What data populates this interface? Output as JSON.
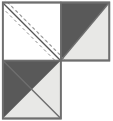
{
  "figure": {
    "title": "",
    "type": "quilt-block-diagram",
    "shape": "L-shaped three-square arrangement",
    "canvas": {
      "width": 113,
      "height": 121
    },
    "background_color": "#FFFFFF"
  },
  "colors": {
    "dark_gray_fabric": "#595959",
    "light_gray_fabric": "#E8E8E6",
    "white_fabric": "#FFFFFF",
    "outline": "#6E6E6E",
    "stitch_line": "#555555",
    "dashed_guide": "#8C8C8C"
  },
  "geometry": {
    "unit": 58,
    "grid_origin_x": 2,
    "grid_origin_y": 2,
    "outline_width": 1.6,
    "stitch_width": 1.3,
    "dash_pattern": "3 3",
    "dash_width": 1.0,
    "guide_offset": 5
  },
  "units": [
    {
      "id": "unit-top-left",
      "name": "white square with stitching guides",
      "label": "",
      "col": 0,
      "row": 0,
      "x": 2,
      "y": 2,
      "size": 58,
      "fill": "#FFFFFF",
      "has_triangle": false,
      "triangle_fill": "",
      "diagonal": "tl-br",
      "stitch_lines": 3,
      "notes": "plain white square marked with one solid sewing line on the diagonal flanked by two dashed guide lines"
    },
    {
      "id": "unit-top-right",
      "name": "half-square triangle unit",
      "label": "",
      "col": 1,
      "row": 0,
      "x": 60,
      "y": 2,
      "size": 51,
      "fill": "#E8E8E6",
      "has_triangle": true,
      "triangle_fill": "#595959",
      "diagonal": "tl-br",
      "triangle_position": "upper-left",
      "stitch_lines": 0,
      "notes": "dark gray triangle above the diagonal, light gray triangle below"
    },
    {
      "id": "unit-bottom-left",
      "name": "half-square triangle unit",
      "label": "",
      "col": 0,
      "row": 1,
      "x": 2,
      "y": 60,
      "size": 59,
      "fill": "#E8E8E6",
      "has_triangle": true,
      "triangle_fill": "#595959",
      "diagonal": "tl-br",
      "triangle_position": "upper-left",
      "stitch_lines": 0,
      "notes": "dark gray triangle above the diagonal, light gray triangle below"
    },
    {
      "id": "unit-bottom-right",
      "name": "empty quadrant",
      "label": "",
      "col": 1,
      "row": 1,
      "x": 60,
      "y": 60,
      "size": 51,
      "fill": "#FFFFFF",
      "has_triangle": false,
      "triangle_fill": "",
      "diagonal": "",
      "stitch_lines": 0,
      "notes": "no piece drawn — background only"
    }
  ],
  "annotations": {
    "caption": "",
    "legend": []
  }
}
